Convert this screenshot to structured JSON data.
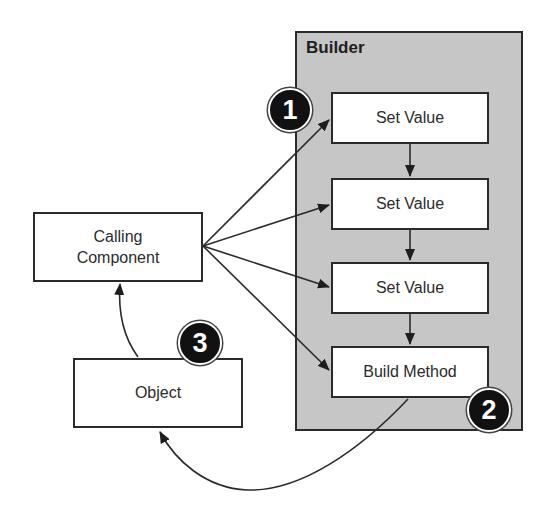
{
  "diagram": {
    "type": "flow",
    "builder": {
      "title": "Builder",
      "steps": [
        {
          "label": "Set Value"
        },
        {
          "label": "Set Value"
        },
        {
          "label": "Set Value"
        },
        {
          "label": "Build Method"
        }
      ]
    },
    "calling_component": {
      "label": "Calling\nComponent"
    },
    "object": {
      "label": "Object"
    },
    "badges": [
      {
        "number": "1"
      },
      {
        "number": "2"
      },
      {
        "number": "3"
      }
    ],
    "edges": [
      {
        "from": "Calling Component",
        "to": "Set Value 1"
      },
      {
        "from": "Calling Component",
        "to": "Set Value 2"
      },
      {
        "from": "Calling Component",
        "to": "Set Value 3"
      },
      {
        "from": "Calling Component",
        "to": "Build Method"
      },
      {
        "from": "Set Value 1",
        "to": "Set Value 2"
      },
      {
        "from": "Set Value 2",
        "to": "Set Value 3"
      },
      {
        "from": "Set Value 3",
        "to": "Build Method"
      },
      {
        "from": "Build Method",
        "to": "Object"
      },
      {
        "from": "Object",
        "to": "Calling Component"
      }
    ],
    "colors": {
      "panel": "#c6c6c6",
      "stroke": "#2a2a2a",
      "badge": "#111111"
    }
  }
}
